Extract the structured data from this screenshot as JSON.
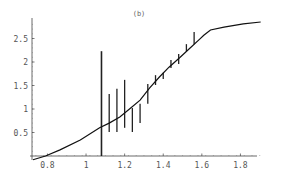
{
  "chart_data": {
    "type": "line",
    "title": "(b)",
    "xlabel": "",
    "ylabel": "",
    "xlim": [
      0.72,
      1.95
    ],
    "ylim": [
      0,
      2.85
    ],
    "x_ticks": [
      0.8,
      1,
      1.2,
      1.4,
      1.6,
      1.8
    ],
    "x_tick_labels": [
      "0.8",
      "1",
      "1.2",
      "1.4",
      "1.6",
      "1.8"
    ],
    "y_ticks": [
      0.5,
      1,
      1.5,
      2,
      2.5
    ],
    "y_tick_labels": [
      "0.5",
      "1",
      "1.5",
      "2",
      "2.5"
    ],
    "grid": false,
    "legend": null,
    "series": [
      {
        "name": "model curve",
        "style": "line",
        "x": [
          0.725,
          0.79,
          0.865,
          0.97,
          1.07,
          1.12,
          1.175,
          1.225,
          1.28,
          1.33,
          1.38,
          1.43,
          1.485,
          1.535,
          1.585,
          1.61,
          1.645,
          1.715,
          1.815,
          1.905
        ],
        "y": [
          -0.08,
          0.0,
          0.13,
          0.34,
          0.6,
          0.7,
          0.83,
          1.0,
          1.19,
          1.45,
          1.68,
          1.89,
          2.09,
          2.28,
          2.47,
          2.57,
          2.68,
          2.74,
          2.81,
          2.85
        ]
      },
      {
        "name": "error bars",
        "style": "errorbar",
        "x": [
          1.08,
          1.12,
          1.16,
          1.2,
          1.24,
          1.28,
          1.32,
          1.36,
          1.4,
          1.44,
          1.48,
          1.52,
          1.56
        ],
        "y_low": [
          0.0,
          0.51,
          0.51,
          0.6,
          0.51,
          0.7,
          1.11,
          1.51,
          1.64,
          1.87,
          1.96,
          2.23,
          2.38
        ],
        "y_high": [
          2.23,
          1.32,
          1.43,
          1.62,
          1.02,
          1.11,
          1.53,
          1.72,
          1.77,
          2.04,
          2.17,
          2.38,
          2.64
        ]
      }
    ]
  }
}
